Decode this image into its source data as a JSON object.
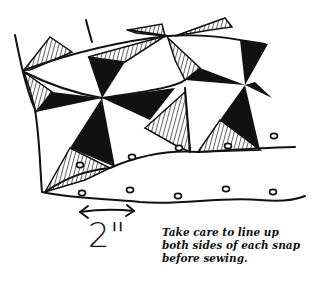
{
  "figure": {
    "type": "sewing instruction illustration",
    "measurement_label": "2\"",
    "caption_lines": [
      "Take care to line up",
      "both sides of each snap",
      "before sewing."
    ],
    "colors": {
      "ink": "#111111",
      "background": "#ffffff"
    }
  }
}
